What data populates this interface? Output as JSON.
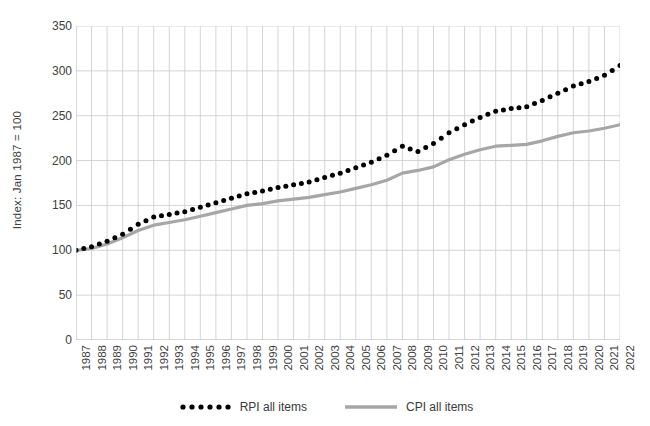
{
  "chart_data": {
    "type": "line",
    "title": "",
    "xlabel": "",
    "ylabel": "Index: Jan 1987 = 100",
    "ylim": [
      0,
      350
    ],
    "yticks": [
      0,
      50,
      100,
      150,
      200,
      250,
      300,
      350
    ],
    "xlim": [
      1987,
      2022
    ],
    "grid": true,
    "legend_position": "bottom",
    "categories": [
      1987,
      1988,
      1989,
      1990,
      1991,
      1992,
      1993,
      1994,
      1995,
      1996,
      1997,
      1998,
      1999,
      2000,
      2001,
      2002,
      2003,
      2004,
      2005,
      2006,
      2007,
      2008,
      2009,
      2010,
      2011,
      2012,
      2013,
      2014,
      2015,
      2016,
      2017,
      2018,
      2019,
      2020,
      2021,
      2022
    ],
    "series": [
      {
        "name": "RPI all items",
        "style": "dotted",
        "color": "#000000",
        "values": [
          100,
          104,
          110,
          118,
          129,
          137,
          140,
          143,
          148,
          153,
          158,
          163,
          166,
          170,
          173,
          176,
          181,
          186,
          192,
          198,
          206,
          216,
          210,
          219,
          231,
          240,
          248,
          255,
          258,
          260,
          267,
          275,
          283,
          288,
          295,
          306
        ]
      },
      {
        "name": "CPI all items",
        "style": "solid",
        "color": "#a6a6a6",
        "values": [
          100,
          102,
          107,
          114,
          122,
          128,
          131,
          134,
          138,
          142,
          146,
          150,
          152,
          155,
          157,
          159,
          162,
          165,
          169,
          173,
          178,
          186,
          189,
          193,
          201,
          207,
          212,
          216,
          217,
          218,
          222,
          227,
          231,
          233,
          236,
          240
        ]
      }
    ]
  },
  "axis": {
    "ytick_labels": [
      "350",
      "300",
      "250",
      "200",
      "150",
      "100",
      "50",
      "0"
    ],
    "xtick_labels": [
      "1987",
      "1988",
      "1989",
      "1990",
      "1991",
      "1992",
      "1993",
      "1994",
      "1995",
      "1996",
      "1997",
      "1998",
      "1999",
      "2000",
      "2001",
      "2002",
      "2003",
      "2004",
      "2005",
      "2006",
      "2007",
      "2008",
      "2009",
      "2010",
      "2011",
      "2012",
      "2013",
      "2014",
      "2015",
      "2016",
      "2017",
      "2018",
      "2019",
      "2020",
      "2021",
      "2022"
    ],
    "ylabel": "Index: Jan 1987 = 100"
  },
  "legend": {
    "items": [
      {
        "label": "RPI all items",
        "marker": "dotted-marker",
        "color": "#000000"
      },
      {
        "label": "CPI all items",
        "marker": "line-marker",
        "color": "#a6a6a6"
      }
    ]
  },
  "colors": {
    "rpi": "#000000",
    "cpi": "#a6a6a6",
    "grid": "#c9c9c9",
    "text": "#404040",
    "background": "#ffffff"
  }
}
